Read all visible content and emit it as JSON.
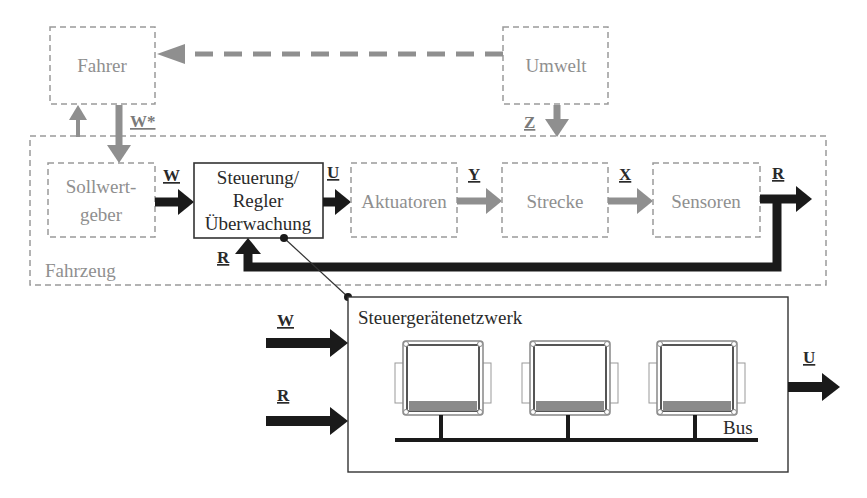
{
  "blocks": {
    "fahrer": "Fahrer",
    "umwelt": "Umwelt",
    "fahrzeug": "Fahrzeug",
    "sollwertgeber_line1": "Sollwert-",
    "sollwertgeber_line2": "geber",
    "steuerung_line1": "Steuerung/",
    "steuerung_line2": "Regler",
    "steuerung_line3": "Überwachung",
    "aktuatoren": "Aktuatoren",
    "strecke": "Strecke",
    "sensoren": "Sensoren",
    "netzwerk": "Steuergerätenetzwerk",
    "bus": "Bus"
  },
  "signals": {
    "w_star": "W*",
    "z": "Z",
    "w": "W",
    "u": "U",
    "y": "Y",
    "x": "X",
    "r": "R",
    "r_feedback": "R",
    "net_w": "W",
    "net_r": "R",
    "net_u": "U"
  },
  "ecus": [
    {
      "name": "ecu-1"
    },
    {
      "name": "ecu-2"
    },
    {
      "name": "ecu-3"
    }
  ]
}
